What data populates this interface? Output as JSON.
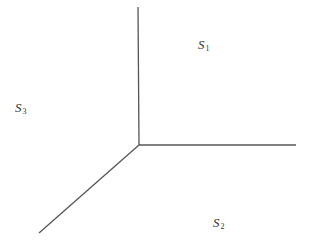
{
  "diagram": {
    "type": "three-ray-partition",
    "line_color": "#555555",
    "origin": {
      "x": 139,
      "y": 145
    },
    "rays": [
      {
        "name": "ray-up",
        "x2": 138,
        "y2": 7
      },
      {
        "name": "ray-right",
        "x2": 296,
        "y2": 145
      },
      {
        "name": "ray-down-left",
        "x2": 39,
        "y2": 233
      }
    ],
    "regions": [
      {
        "name": "region-s1",
        "symbol": "S",
        "subscript": "1",
        "x": 198,
        "y": 38
      },
      {
        "name": "region-s3",
        "symbol": "S",
        "subscript": "3",
        "x": 15,
        "y": 101
      },
      {
        "name": "region-s2",
        "symbol": "S",
        "subscript": "2",
        "x": 213,
        "y": 216
      }
    ]
  }
}
